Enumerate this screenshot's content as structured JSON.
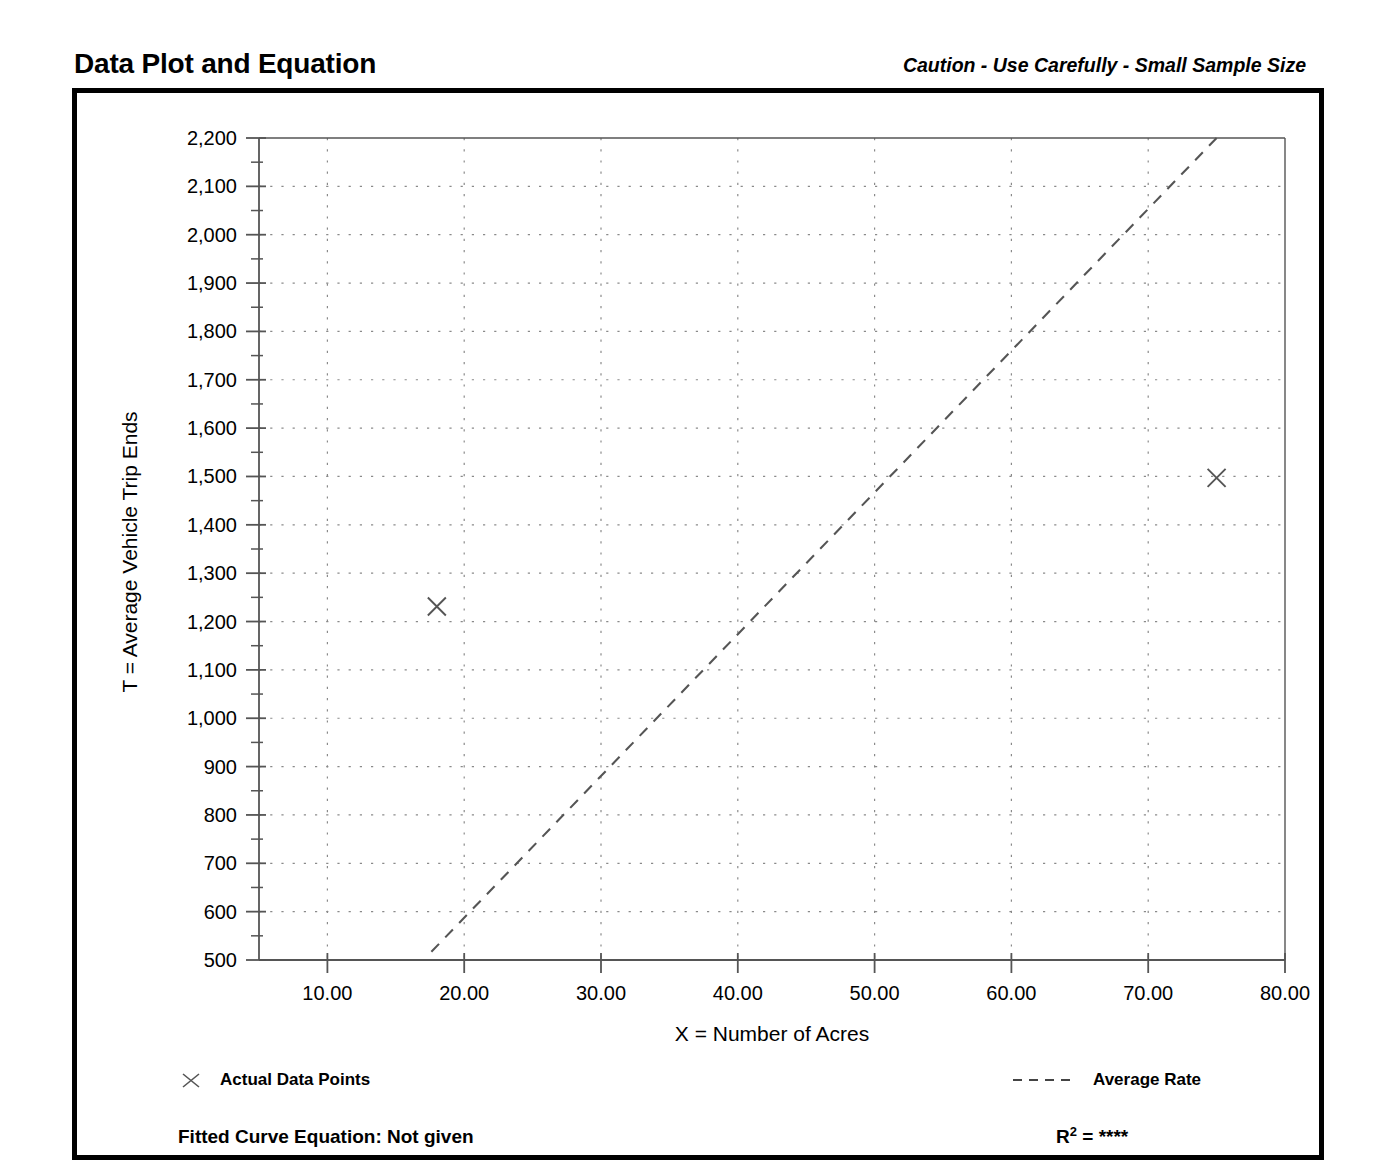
{
  "header": {
    "title": "Data Plot and Equation",
    "caution": "Caution - Use Carefully - Small Sample Size"
  },
  "legend": {
    "points_label": "Actual Data Points",
    "points_marker": "x-marker-icon",
    "line_label": "Average Rate",
    "line_marker": "dashed-line-icon"
  },
  "footer": {
    "equation_label": "Fitted Curve Equation:",
    "equation_value": "Not given",
    "equation_full": "Fitted Curve Equation:  Not given",
    "r2_symbol": "R",
    "r2_exponent": "2",
    "r2_equals": "=",
    "r2_value": "****"
  },
  "colors": {
    "ink": "#000000",
    "axis": "#555555",
    "grid": "#8a8a8a",
    "data": "#555555",
    "frame": "#000000",
    "background": "#ffffff"
  },
  "chart_data": {
    "type": "scatter",
    "title": "Data Plot and Equation",
    "subtitle": "Caution - Use Carefully - Small Sample Size",
    "xlabel": "X = Number of Acres",
    "ylabel": "T = Average Vehicle Trip Ends",
    "xlim": [
      5.0,
      80.0
    ],
    "ylim": [
      500,
      2200
    ],
    "xticks": [
      10.0,
      20.0,
      30.0,
      40.0,
      50.0,
      60.0,
      70.0,
      80.0
    ],
    "xticklabels": [
      "10.00",
      "20.00",
      "30.00",
      "40.00",
      "50.00",
      "60.00",
      "70.00",
      "80.00"
    ],
    "yticks": [
      500,
      600,
      700,
      800,
      900,
      1000,
      1100,
      1200,
      1300,
      1400,
      1500,
      1600,
      1700,
      1800,
      1900,
      2000,
      2100,
      2200
    ],
    "yticklabels": [
      "500",
      "600",
      "700",
      "800",
      "900",
      "1,000",
      "1,100",
      "1,200",
      "1,300",
      "1,400",
      "1,500",
      "1,600",
      "1,700",
      "1,800",
      "1,900",
      "2,000",
      "2,100",
      "2,200"
    ],
    "y_minor_tick_step": 50,
    "grid": true,
    "grid_style": "dotted",
    "legend_position": "below-plot",
    "series": [
      {
        "name": "Actual Data Points",
        "type": "scatter",
        "marker": "x",
        "points": [
          {
            "x": 18.0,
            "y": 1231
          },
          {
            "x": 75.0,
            "y": 1497
          }
        ]
      },
      {
        "name": "Average Rate",
        "type": "line",
        "style": "dashed",
        "points": [
          {
            "x": 17.6,
            "y": 517
          },
          {
            "x": 75.0,
            "y": 2200
          }
        ],
        "slope": 29.3,
        "through_origin": true
      }
    ]
  }
}
